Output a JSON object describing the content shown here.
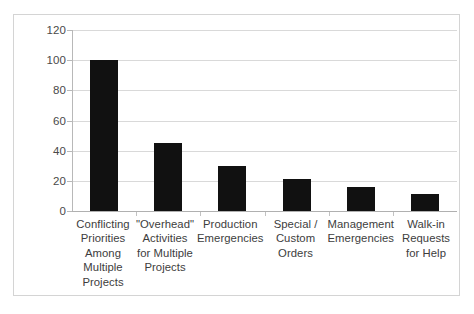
{
  "chart_data": {
    "type": "bar",
    "title": "",
    "subtitle": "",
    "xlabel": "",
    "ylabel": "",
    "ylim": [
      0,
      120
    ],
    "yticks": [
      0,
      20,
      40,
      60,
      80,
      100,
      120
    ],
    "ytick_labels": [
      "0",
      "20",
      "40",
      "60",
      "80",
      "100",
      "120"
    ],
    "grid": "horizontal",
    "legend": "none",
    "bar_color": "#111111",
    "grid_color": "#d9d9d9",
    "axis_color": "#b8b8b8",
    "frame_color": "#d4d4d4",
    "background": "#ffffff",
    "categories": [
      "Conflicting Priorities Among Multiple Projects",
      "\"Overhead\" Activities for Multiple Projects",
      "Production Emergencies",
      "Special / Custom Orders",
      "Management Emergencies",
      "Walk-in Requests for Help"
    ],
    "values": [
      100,
      45,
      30,
      21,
      16,
      11
    ]
  },
  "axis": {
    "y_ticks": [
      {
        "label": "120",
        "value": 120
      },
      {
        "label": "100",
        "value": 100
      },
      {
        "label": "80",
        "value": 80
      },
      {
        "label": "60",
        "value": 60
      },
      {
        "label": "40",
        "value": 40
      },
      {
        "label": "20",
        "value": 20
      },
      {
        "label": "0",
        "value": 0
      }
    ]
  },
  "categories_wrapped": [
    "Conflicting Priorities Among Multiple Projects",
    "\"Overhead\" Activities for Multiple Projects",
    "Production Emergencies",
    "Special / Custom Orders",
    "Management Emergencies",
    "Walk-in Requests for Help"
  ]
}
